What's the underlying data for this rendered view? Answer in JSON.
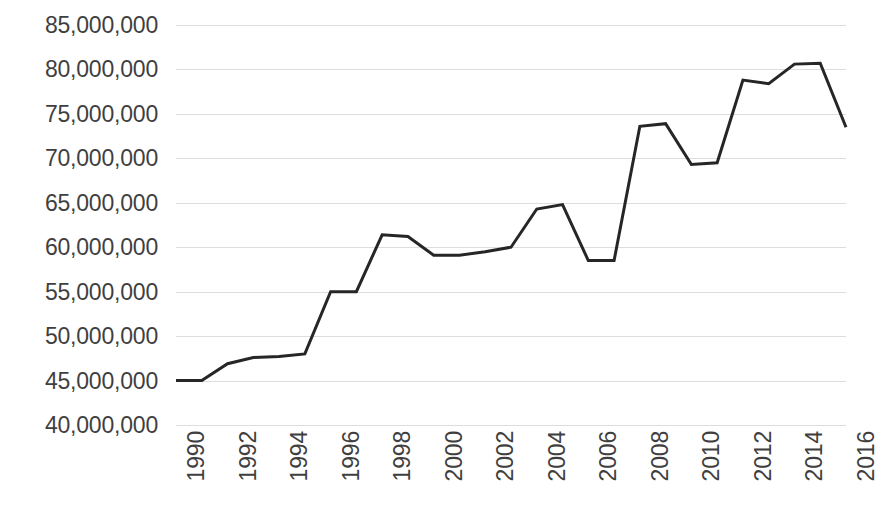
{
  "chart_data": {
    "type": "line",
    "title": "",
    "subtitle": "",
    "xlabel": "",
    "ylabel": "",
    "grid": true,
    "legend": false,
    "legend_position": "none",
    "line_color": "#262626",
    "gridline_color": "#DDDDDD",
    "background_color": "#FFFFFF",
    "tick_label_color": "#3F3F3F",
    "line_width_px": 3,
    "xlim": [
      1990,
      2016
    ],
    "ylim": [
      40000000,
      85000000
    ],
    "y_tick_step": 5000000,
    "x_tick_step": 2,
    "y_tick_labels": [
      "85,000,000",
      "80,000,000",
      "75,000,000",
      "70,000,000",
      "65,000,000",
      "60,000,000",
      "55,000,000",
      "50,000,000",
      "45,000,000",
      "40,000,000"
    ],
    "y_tick_values": [
      85000000,
      80000000,
      75000000,
      70000000,
      65000000,
      60000000,
      55000000,
      50000000,
      45000000,
      40000000
    ],
    "x_tick_labels": [
      "1990",
      "1992",
      "1994",
      "1996",
      "1998",
      "2000",
      "2002",
      "2004",
      "2006",
      "2008",
      "2010",
      "2012",
      "2014",
      "2016"
    ],
    "x_tick_values": [
      1990,
      1992,
      1994,
      1996,
      1998,
      2000,
      2002,
      2004,
      2006,
      2008,
      2010,
      2012,
      2014,
      2016
    ],
    "x": [
      1990,
      1991,
      1992,
      1993,
      1994,
      1995,
      1996,
      1997,
      1998,
      1999,
      2000,
      2001,
      2002,
      2003,
      2004,
      2005,
      2006,
      2007,
      2008,
      2009,
      2010,
      2011,
      2012,
      2013,
      2014,
      2015,
      2016
    ],
    "values": [
      45000000,
      45000000,
      46900000,
      47600000,
      47700000,
      48000000,
      55000000,
      55000000,
      61400000,
      61200000,
      59100000,
      59100000,
      59500000,
      60000000,
      64300000,
      64800000,
      58500000,
      58500000,
      73600000,
      73900000,
      69300000,
      69500000,
      78800000,
      78400000,
      80600000,
      80700000,
      73500000
    ],
    "series": [
      {
        "name": "",
        "color": "#262626",
        "values": [
          45000000,
          45000000,
          46900000,
          47600000,
          47700000,
          48000000,
          55000000,
          55000000,
          61400000,
          61200000,
          59100000,
          59100000,
          59500000,
          60000000,
          64300000,
          64800000,
          58500000,
          58500000,
          73600000,
          73900000,
          69300000,
          69500000,
          78800000,
          78400000,
          80600000,
          80700000,
          73500000
        ]
      }
    ]
  }
}
